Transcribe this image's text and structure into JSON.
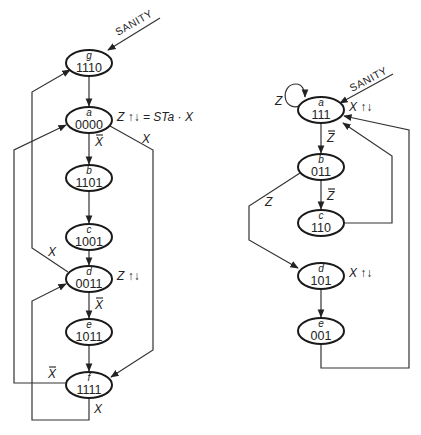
{
  "diagrams": [
    {
      "id": "left",
      "reset_label": "SANITY",
      "states": [
        {
          "name": "g",
          "code": "1110"
        },
        {
          "name": "a",
          "code": "0000",
          "output": "Z ↑↓ = STa · X"
        },
        {
          "name": "b",
          "code": "1101"
        },
        {
          "name": "c",
          "code": "1001"
        },
        {
          "name": "d",
          "code": "0011",
          "output": "Z ↑↓"
        },
        {
          "name": "e",
          "code": "1011"
        },
        {
          "name": "f",
          "code": "1111"
        }
      ],
      "transitions": [
        {
          "from": "g",
          "to": "a",
          "label": ""
        },
        {
          "from": "a",
          "to": "b",
          "label": "X̄"
        },
        {
          "from": "a",
          "to": "f",
          "label": "X"
        },
        {
          "from": "b",
          "to": "c",
          "label": ""
        },
        {
          "from": "c",
          "to": "d",
          "label": ""
        },
        {
          "from": "d",
          "to": "g",
          "label": "X"
        },
        {
          "from": "d",
          "to": "e",
          "label": "X̄"
        },
        {
          "from": "e",
          "to": "f",
          "label": ""
        },
        {
          "from": "f",
          "to": "a",
          "label": "X̄"
        },
        {
          "from": "f",
          "to": "d",
          "label": "X"
        }
      ]
    },
    {
      "id": "right",
      "reset_label": "SANITY",
      "states": [
        {
          "name": "a",
          "code": "111",
          "output": "X ↑↓"
        },
        {
          "name": "b",
          "code": "011"
        },
        {
          "name": "c",
          "code": "110"
        },
        {
          "name": "d",
          "code": "101",
          "output": "X ↑↓"
        },
        {
          "name": "e",
          "code": "001"
        }
      ],
      "transitions": [
        {
          "from": "a",
          "to": "a",
          "label": "Z"
        },
        {
          "from": "a",
          "to": "b",
          "label": "Z̄"
        },
        {
          "from": "b",
          "to": "c",
          "label": "Z̄"
        },
        {
          "from": "b",
          "to": "d",
          "label": "Z"
        },
        {
          "from": "c",
          "to": "a",
          "label": ""
        },
        {
          "from": "d",
          "to": "e",
          "label": ""
        },
        {
          "from": "e",
          "to": "a",
          "label": ""
        }
      ]
    }
  ],
  "labels": {
    "x": "X",
    "x_bar": "X",
    "z": "Z",
    "z_bar": "Z"
  }
}
